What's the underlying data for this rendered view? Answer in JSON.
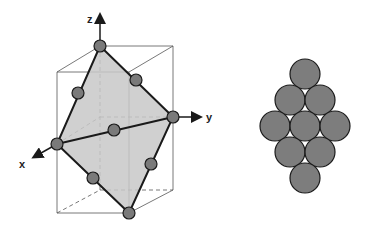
{
  "diagram": {
    "left": {
      "title": "octahedral plane in unit cell",
      "axes": {
        "x_label": "x",
        "y_label": "y",
        "z_label": "z"
      },
      "colors": {
        "plane_fill": "#c8c8c8",
        "sphere_fill": "#7a7a7a",
        "edge": "#1a1a1a",
        "box": "#555555"
      }
    },
    "right": {
      "title": "close-packed sphere arrangement",
      "rows": [
        1,
        2,
        3,
        2,
        1
      ],
      "colors": {
        "sphere_fill": "#7d7d7d",
        "outline": "#1a1a1a"
      }
    }
  }
}
